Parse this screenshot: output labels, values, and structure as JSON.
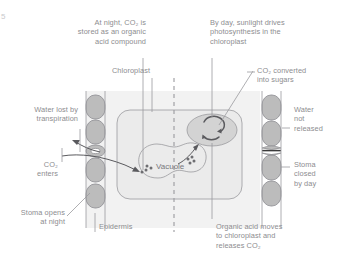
{
  "figure": {
    "title_mark": "5",
    "width": 346,
    "height": 265,
    "background_color": "#ffffff",
    "text_color": "#8d8d90",
    "line_color": "#9a9a9e",
    "cell_fill": "#f2f2f2",
    "organelle_fill": "#ebebeb",
    "guard_cell_fill": "#bcbcbc",
    "stoma_closed_color": "#3b3b3b"
  },
  "annotations": {
    "night_store": "At night, CO₂ is\nstored as an organic\nacid compound",
    "day_photosynthesis": "By day, sunlight drives\nphotosynthesis in the\nchloroplast",
    "chloroplast": "Chloroplast",
    "co2_converted": "CO₂ converted\ninto sugars",
    "water_lost": "Water lost by\ntranspiration",
    "co2_enters": "CO₂\nenters",
    "stoma_opens": "Stoma opens\nat night",
    "epidermis": "Epidermis",
    "water_not_released": "Water\nnot\nreleased",
    "stoma_closed": "Stoma\nclosed\nby day",
    "organic_acid_moves": "Organic acid moves\nto chloroplast and\nreleases CO₂",
    "vacuole": "Vacuole"
  },
  "icon_names": {
    "leaf_cell": "leaf-cell-shape",
    "chloroplast": "chloroplast-oval-icon",
    "vacuole": "vacuole-blob-icon",
    "guard_cell": "guard-cell-icon",
    "cycle_arrow": "circular-arrow-icon",
    "co2_dots": "co2-particle-dots-icon",
    "divider": "day-night-dashed-divider"
  }
}
